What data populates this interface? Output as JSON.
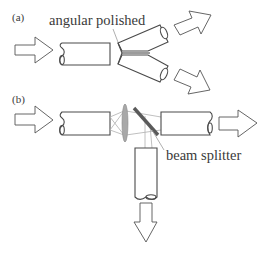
{
  "diagram": {
    "panels": [
      {
        "id": "a",
        "label": "(a)",
        "annotation": "angular polished",
        "elements": [
          "input-arrow",
          "input-fiber",
          "angular-polished-split-fiber",
          "output-arrow-upper",
          "output-arrow-lower"
        ]
      },
      {
        "id": "b",
        "label": "(b)",
        "annotation": "beam splitter",
        "elements": [
          "input-arrow",
          "input-fiber",
          "lens",
          "beam-splitter",
          "output-fiber-straight",
          "output-arrow-straight",
          "output-fiber-down",
          "output-arrow-down"
        ]
      }
    ],
    "colors": {
      "line": "#4a4a4a",
      "lens": "#a8a8a8",
      "rays": "#b0b0b0",
      "text": "#3a3a3a"
    }
  }
}
